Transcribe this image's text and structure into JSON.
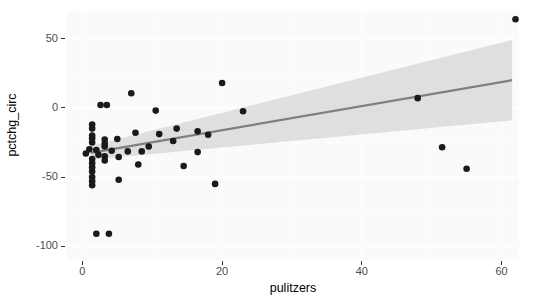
{
  "chart_data": {
    "type": "scatter",
    "title": "",
    "xlabel": "pulitzers",
    "ylabel": "pctchg_circ",
    "xlim": [
      -2.2,
      62.5
    ],
    "ylim": [
      -110,
      70
    ],
    "xticks": [
      0,
      20,
      40,
      60
    ],
    "xticklabels": [
      "0",
      "20",
      "40",
      "60"
    ],
    "yticks": [
      50,
      0,
      -50,
      -100
    ],
    "yticklabels": [
      "50",
      "0",
      "-50",
      "-100"
    ],
    "grid": true,
    "legend": "none",
    "point_color": "#1a1a1a",
    "line_color": "#7f7f7f",
    "band_color": "#d9d9d9",
    "panel_color": "#fafafa",
    "points": [
      {
        "x": 62.0,
        "y": 64.0
      },
      {
        "x": 20.0,
        "y": 18.0
      },
      {
        "x": 7.0,
        "y": 10.5
      },
      {
        "x": 48.0,
        "y": 7.0
      },
      {
        "x": 3.5,
        "y": 2.0
      },
      {
        "x": 2.6,
        "y": 2.0
      },
      {
        "x": 10.5,
        "y": -2.0
      },
      {
        "x": 23.0,
        "y": -2.5
      },
      {
        "x": 1.4,
        "y": -12.0
      },
      {
        "x": 1.4,
        "y": -15.0
      },
      {
        "x": 13.5,
        "y": -15.0
      },
      {
        "x": 16.5,
        "y": -17.0
      },
      {
        "x": 7.6,
        "y": -18.0
      },
      {
        "x": 11.0,
        "y": -19.0
      },
      {
        "x": 18.0,
        "y": -19.5
      },
      {
        "x": 1.4,
        "y": -20.0
      },
      {
        "x": 1.4,
        "y": -22.0
      },
      {
        "x": 5.0,
        "y": -22.5
      },
      {
        "x": 3.2,
        "y": -23.0
      },
      {
        "x": 13.0,
        "y": -24.0
      },
      {
        "x": 1.4,
        "y": -25.0
      },
      {
        "x": 3.2,
        "y": -26.0
      },
      {
        "x": 3.2,
        "y": -28.0
      },
      {
        "x": 9.5,
        "y": -28.0
      },
      {
        "x": 51.5,
        "y": -28.5
      },
      {
        "x": 1.0,
        "y": -30.0
      },
      {
        "x": 2.0,
        "y": -30.5
      },
      {
        "x": 4.2,
        "y": -31.0
      },
      {
        "x": 6.5,
        "y": -31.5
      },
      {
        "x": 8.5,
        "y": -31.5
      },
      {
        "x": 16.5,
        "y": -32.0
      },
      {
        "x": 0.5,
        "y": -33.0
      },
      {
        "x": 2.3,
        "y": -34.0
      },
      {
        "x": 3.2,
        "y": -35.0
      },
      {
        "x": 5.2,
        "y": -35.5
      },
      {
        "x": 1.4,
        "y": -37.0
      },
      {
        "x": 3.2,
        "y": -38.0
      },
      {
        "x": 1.4,
        "y": -40.0
      },
      {
        "x": 1.4,
        "y": -43.0
      },
      {
        "x": 8.0,
        "y": -41.0
      },
      {
        "x": 14.5,
        "y": -42.0
      },
      {
        "x": 55.0,
        "y": -44.0
      },
      {
        "x": 1.4,
        "y": -46.0
      },
      {
        "x": 1.4,
        "y": -50.0
      },
      {
        "x": 5.2,
        "y": -52.0
      },
      {
        "x": 1.4,
        "y": -53.0
      },
      {
        "x": 1.4,
        "y": -56.0
      },
      {
        "x": 19.0,
        "y": -55.0
      },
      {
        "x": 2.0,
        "y": -91.0
      },
      {
        "x": 3.8,
        "y": -91.0
      }
    ],
    "regression": {
      "x_start": 1.2,
      "x_end": 61.5,
      "y_start": -32.5,
      "y_end": 20.0,
      "ci_upper_start": -27.5,
      "ci_upper_end": 49.0,
      "ci_lower_start": -37.5,
      "ci_lower_end": -9.0
    }
  },
  "axes": {
    "x_title": "pulitzers",
    "y_title": "pctchg_circ"
  }
}
